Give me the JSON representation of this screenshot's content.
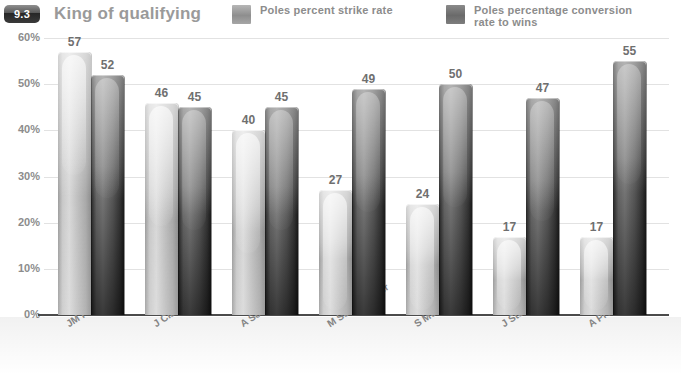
{
  "header": {
    "badge": "9.3",
    "title": "King of qualifying"
  },
  "legend": {
    "position": "top-right",
    "items": [
      {
        "label": "Poles percent  strike rate",
        "swatch": "legend-swatch-light",
        "color": "#a0a0a0"
      },
      {
        "label": "Poles percentage conversion\nrate to wins",
        "swatch": "legend-swatch-dark",
        "color": "#6f6f6f"
      }
    ]
  },
  "chart_data": {
    "type": "bar",
    "title": "King of qualifying",
    "xlabel": "",
    "ylabel": "",
    "ylim": [
      0,
      60
    ],
    "ytick_labels": [
      "0%",
      "10%",
      "20%",
      "30%",
      "40%",
      "50%",
      "60%"
    ],
    "ytick_values": [
      0,
      10,
      20,
      30,
      40,
      50,
      60
    ],
    "grid": true,
    "legend_position": "top-right",
    "categories": [
      "JM Fangio",
      "J Clark",
      "A Senna",
      "M Schumacher",
      "S Moss",
      "J Stewart",
      "A Prost"
    ],
    "series": [
      {
        "name": "Poles percent  strike rate",
        "color": "#c2c2c2",
        "values": [
          57,
          46,
          40,
          27,
          24,
          17,
          17
        ]
      },
      {
        "name": "Poles percentage conversion rate to wins",
        "color": "#3a3a3a",
        "values": [
          52,
          45,
          45,
          49,
          50,
          47,
          55
        ]
      }
    ]
  }
}
